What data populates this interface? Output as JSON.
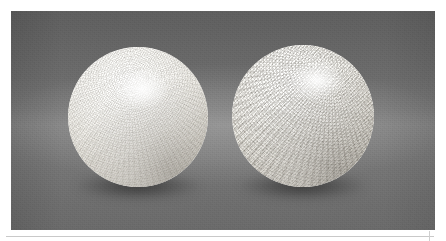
{
  "figure": {
    "background_color_top": "#5e5e5e",
    "background_color_mid": "#818181",
    "background_color_bottom": "#6a6a6a",
    "plate": {
      "left": 11,
      "top": 11,
      "width": 424,
      "height": 219
    },
    "objects": [
      {
        "id": "sphere-left",
        "label": "Left sphere",
        "surface": "fine dimpled microfacet texture",
        "pattern": "tight concentric spiral, low contrast",
        "base_color": "#f2f1ee",
        "highlight_color": "#ffffff",
        "shadow_color": "#a29d93",
        "center_x": 127,
        "center_y": 106,
        "diameter": 140
      },
      {
        "id": "sphere-right",
        "label": "Right sphere",
        "surface": "coarse cross-hatched dimple texture",
        "pattern": "pronounced swirl toward upper right, high contrast",
        "base_color": "#f2f1ee",
        "highlight_color": "#ffffff",
        "shadow_color": "#a29d93",
        "center_x": 303,
        "center_y": 105,
        "diameter": 142
      }
    ],
    "shadows": [
      {
        "id": "shadow-left",
        "label": "Contact shadow under left sphere"
      },
      {
        "id": "shadow-right",
        "label": "Contact shadow under right sphere"
      }
    ],
    "caption_rule": {
      "visible": true,
      "color": "#c9c9c9"
    }
  }
}
